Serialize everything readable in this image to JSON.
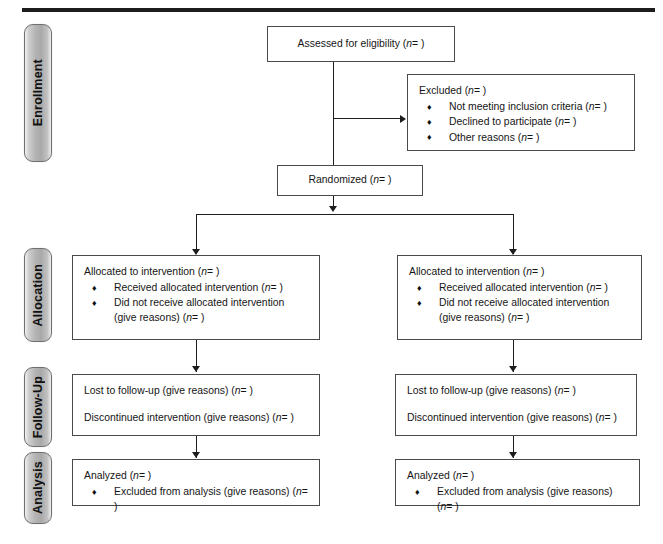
{
  "diagram": {
    "top_rule": true,
    "stages": [
      {
        "id": "enrollment",
        "label": "Enrollment"
      },
      {
        "id": "allocation",
        "label": "Allocation"
      },
      {
        "id": "followup",
        "label": "Follow-Up"
      },
      {
        "id": "analysis",
        "label": "Analysis"
      }
    ],
    "boxes": {
      "assessed": {
        "label": "Assessed for eligibility (n= )",
        "text_before": "Assessed for eligibility (",
        "italic": "n",
        "text_after": "= )"
      },
      "excluded": {
        "heading_before": "Excluded  (",
        "heading_italic": "n",
        "heading_after": "= )",
        "heading": "Excluded  (n= )",
        "bullet_char": "♦",
        "bullets": [
          {
            "before": "Not meeting inclusion criteria (",
            "italic": "n",
            "after": "= )",
            "text": "Not meeting inclusion criteria (n= )"
          },
          {
            "before": "Declined to participate (",
            "italic": "n",
            "after": "= )",
            "text": "Declined to participate (n= )"
          },
          {
            "before": "Other reasons (",
            "italic": "n",
            "after": "= )",
            "text": "Other reasons (n= )"
          }
        ]
      },
      "randomized": {
        "label": "Randomized (n= )",
        "text_before": "Randomized (",
        "italic": "n",
        "text_after": "= )"
      },
      "allocated_left": {
        "heading_before": "Allocated to intervention (",
        "heading_italic": "n",
        "heading_after": "= )",
        "heading": "Allocated to intervention (n= )",
        "bullet_char": "♦",
        "bullets": [
          {
            "before": "Received allocated intervention (",
            "italic": "n",
            "after": "= )",
            "text": "Received allocated intervention (n= )"
          },
          {
            "before": "Did not receive allocated intervention (give reasons) (",
            "italic": "n",
            "after": "= )",
            "text": "Did not receive allocated intervention (give reasons) (n= )"
          }
        ]
      },
      "allocated_right": {
        "heading_before": "Allocated to intervention (",
        "heading_italic": "n",
        "heading_after": "= )",
        "heading": "Allocated to intervention (n= )",
        "bullet_char": "♦",
        "bullets": [
          {
            "before": "Received allocated intervention (",
            "italic": "n",
            "after": "= )",
            "text": "Received allocated intervention (n= )"
          },
          {
            "before": "Did not receive allocated intervention (give reasons) (",
            "italic": "n",
            "after": "= )",
            "text": "Did not receive allocated intervention (give reasons) (n= )"
          }
        ]
      },
      "followup_left": {
        "line1_before": "Lost to follow-up (give reasons) (",
        "line1_italic": "n",
        "line1_after": "= )",
        "line1": "Lost to follow-up (give reasons) (n= )",
        "line2_before": "Discontinued intervention (give reasons) (",
        "line2_italic": "n",
        "line2_after": "= )",
        "line2": "Discontinued intervention (give reasons) (n= )"
      },
      "followup_right": {
        "line1_before": "Lost to follow-up (give reasons) (",
        "line1_italic": "n",
        "line1_after": "= )",
        "line1": "Lost to follow-up (give reasons) (n= )",
        "line2_before": "Discontinued intervention (give reasons) (",
        "line2_italic": "n",
        "line2_after": "= )",
        "line2": "Discontinued intervention (give reasons) (n= )"
      },
      "analysis_left": {
        "heading_before": "Analyzed  (",
        "heading_italic": "n",
        "heading_after": "= )",
        "heading": "Analyzed  (n= )",
        "bullet_char": "♦",
        "bullets": [
          {
            "before": "Excluded from analysis (give reasons) (",
            "italic": "n",
            "after": "= )",
            "text": "Excluded from analysis (give reasons) (n= )"
          }
        ]
      },
      "analysis_right": {
        "heading_before": "Analyzed  (",
        "heading_italic": "n",
        "heading_after": "= )",
        "heading": "Analyzed  (n= )",
        "bullet_char": "♦",
        "bullets": [
          {
            "before": "Excluded from analysis (give reasons) (",
            "italic": "n",
            "after": "= )",
            "text": "Excluded from analysis (give reasons) (n= )"
          }
        ]
      }
    },
    "colors": {
      "line": "#1d1d1d",
      "box_border": "#4a4a4a",
      "pill_border": "#6f6f6f",
      "pill_fill": "#ababab",
      "text": "#151515",
      "background": "#ffffff"
    }
  }
}
